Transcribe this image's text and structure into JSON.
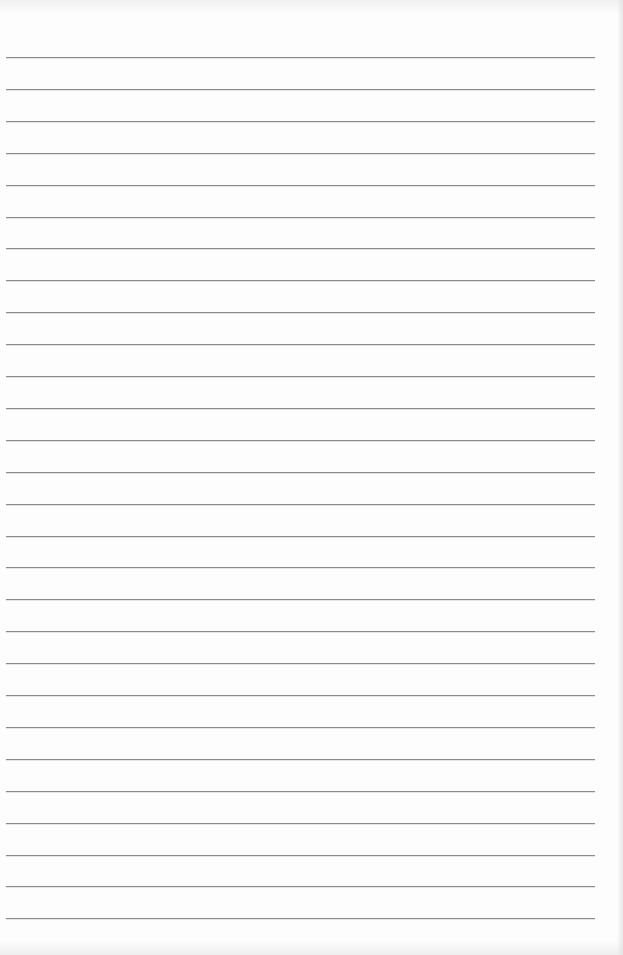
{
  "document": {
    "type": "lined-paper",
    "background_color": "#fdfdfd",
    "rule_color": "#8a8a8a",
    "rule_count": 28,
    "first_rule_y": 57,
    "rule_spacing": 31.9,
    "rule_left_x": 6,
    "rule_right_x": 595,
    "text_content": []
  }
}
